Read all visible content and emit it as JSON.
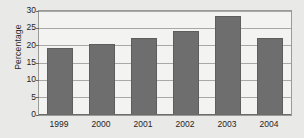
{
  "chart_data": {
    "type": "bar",
    "title": "",
    "subtitle": "",
    "xlabel": "",
    "ylabel": "Percentage",
    "categories": [
      "1999",
      "2000",
      "2001",
      "2002",
      "2003",
      "2004"
    ],
    "values": [
      19.3,
      20.2,
      22.1,
      24.2,
      28.3,
      22.2
    ],
    "ylim": [
      0,
      30
    ],
    "ytick_labels": [
      "0",
      "5",
      "10",
      "15",
      "20",
      "25",
      "30"
    ],
    "ytick_values": [
      0,
      5,
      10,
      15,
      20,
      25,
      30
    ],
    "grid": "horizontal",
    "legend": "none",
    "annotations": [],
    "colors": {
      "bar_fill": "#6e6e6e",
      "bar_edge": "#5d5d5d",
      "plot_background": "#f3f3f1",
      "page_background": "#e9e9e7",
      "gridline": "#a8a8a6",
      "axis": "#6b6b69",
      "text": "#1f1f1f"
    }
  }
}
